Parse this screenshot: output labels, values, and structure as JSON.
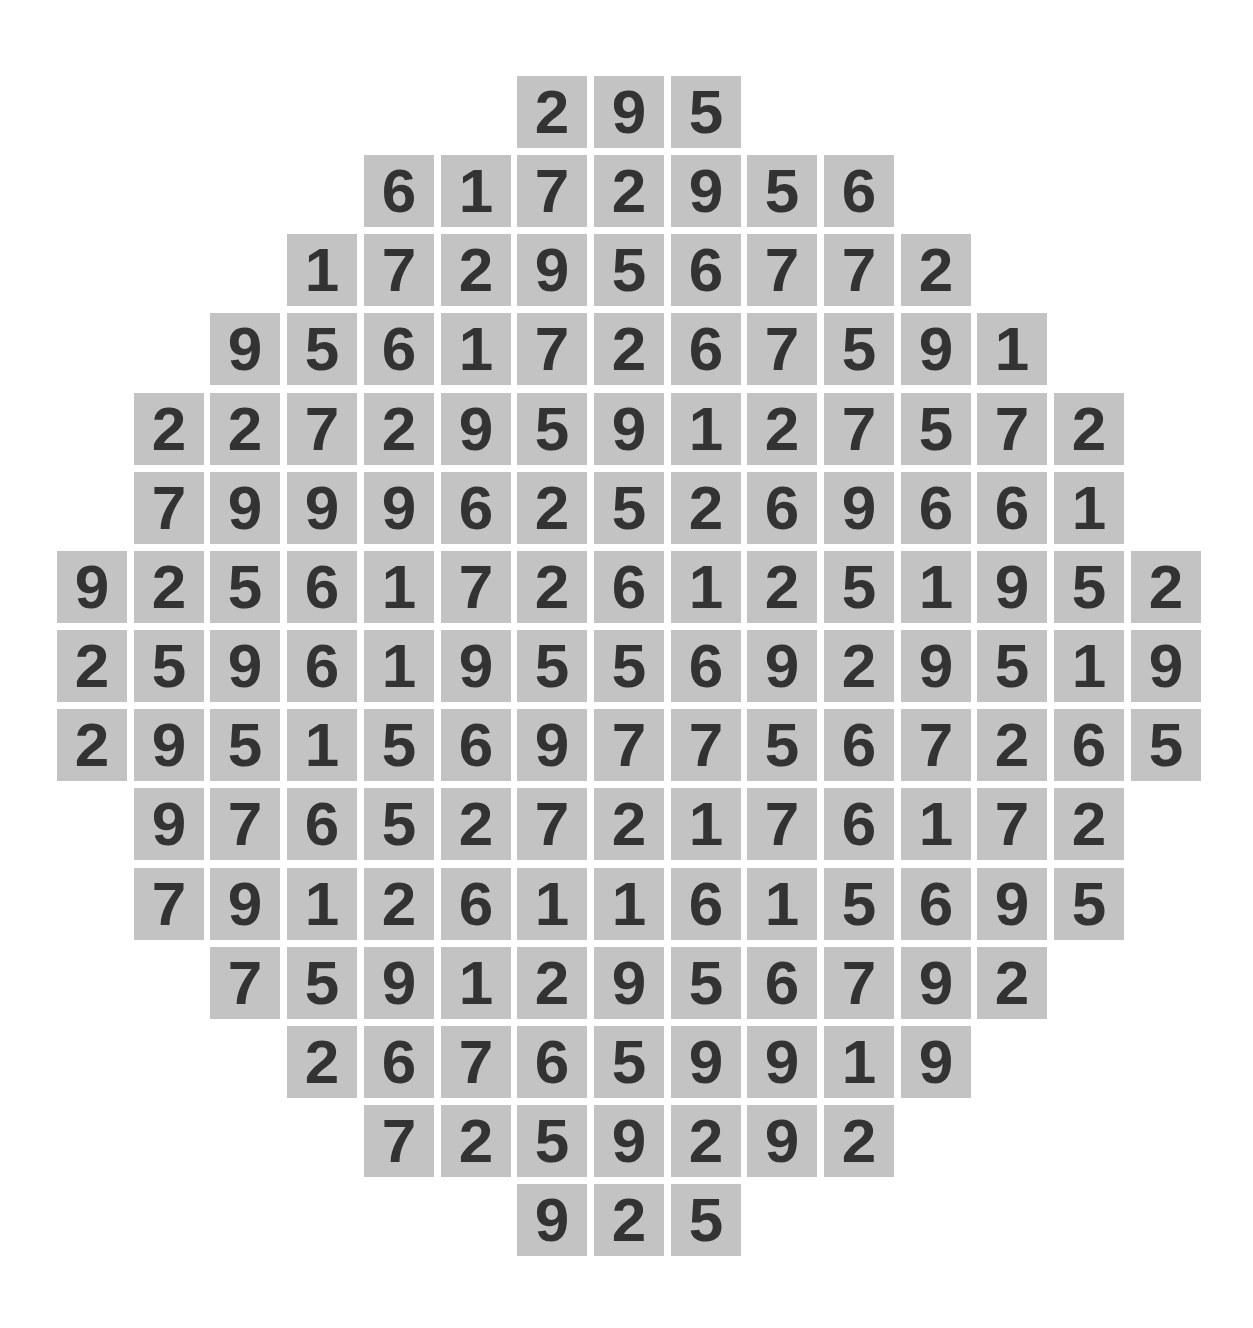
{
  "puzzle": {
    "layout": {
      "col_pitch": 76.7,
      "row_pitch": 79.15,
      "origin_x": 57,
      "origin_y": 76,
      "tile_color": "#c3c3c3",
      "digit_color": "#333333"
    },
    "rows": [
      {
        "start_col": 6,
        "digits": [
          "2",
          "9",
          "5"
        ]
      },
      {
        "start_col": 4,
        "digits": [
          "6",
          "1",
          "7",
          "2",
          "9",
          "5",
          "6"
        ]
      },
      {
        "start_col": 3,
        "digits": [
          "1",
          "7",
          "2",
          "9",
          "5",
          "6",
          "7",
          "7",
          "2"
        ]
      },
      {
        "start_col": 2,
        "digits": [
          "9",
          "5",
          "6",
          "1",
          "7",
          "2",
          "6",
          "7",
          "5",
          "9",
          "1"
        ]
      },
      {
        "start_col": 1,
        "digits": [
          "2",
          "2",
          "7",
          "2",
          "9",
          "5",
          "9",
          "1",
          "2",
          "7",
          "5",
          "7",
          "2"
        ]
      },
      {
        "start_col": 1,
        "digits": [
          "7",
          "9",
          "9",
          "9",
          "6",
          "2",
          "5",
          "2",
          "6",
          "9",
          "6",
          "6",
          "1"
        ]
      },
      {
        "start_col": 0,
        "digits": [
          "9",
          "2",
          "5",
          "6",
          "1",
          "7",
          "2",
          "6",
          "1",
          "2",
          "5",
          "1",
          "9",
          "5",
          "2"
        ]
      },
      {
        "start_col": 0,
        "digits": [
          "2",
          "5",
          "9",
          "6",
          "1",
          "9",
          "5",
          "5",
          "6",
          "9",
          "2",
          "9",
          "5",
          "1",
          "9"
        ]
      },
      {
        "start_col": 0,
        "digits": [
          "2",
          "9",
          "5",
          "1",
          "5",
          "6",
          "9",
          "7",
          "7",
          "5",
          "6",
          "7",
          "2",
          "6",
          "5"
        ]
      },
      {
        "start_col": 1,
        "digits": [
          "9",
          "7",
          "6",
          "5",
          "2",
          "7",
          "2",
          "1",
          "7",
          "6",
          "1",
          "7",
          "2"
        ]
      },
      {
        "start_col": 1,
        "digits": [
          "7",
          "9",
          "1",
          "2",
          "6",
          "1",
          "1",
          "6",
          "1",
          "5",
          "6",
          "9",
          "5"
        ]
      },
      {
        "start_col": 2,
        "digits": [
          "7",
          "5",
          "9",
          "1",
          "2",
          "9",
          "5",
          "6",
          "7",
          "9",
          "2"
        ]
      },
      {
        "start_col": 3,
        "digits": [
          "2",
          "6",
          "7",
          "6",
          "5",
          "9",
          "9",
          "1",
          "9"
        ]
      },
      {
        "start_col": 4,
        "digits": [
          "7",
          "2",
          "5",
          "9",
          "2",
          "9",
          "2"
        ]
      },
      {
        "start_col": 6,
        "digits": [
          "9",
          "2",
          "5"
        ]
      }
    ]
  }
}
